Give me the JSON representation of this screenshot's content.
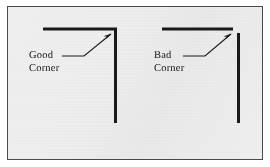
{
  "figure": {
    "background_color": "#eeeeee",
    "border_color": "#4a4a4a",
    "ink_color": "#1a1a1a",
    "page_color": "#ffffff",
    "caption": ""
  },
  "panels": [
    {
      "id": "good",
      "quality": "good",
      "label_line1": "Good",
      "label_line2": "Corner",
      "corner_gap_px": 0,
      "horizontal_line": {
        "x1": 42,
        "y1": 28,
        "x2": 116,
        "y2": 28
      },
      "vertical_line": {
        "x1": 114,
        "y1": 28,
        "x2": 114,
        "y2": 122
      },
      "leader_line": {
        "x1": 61,
        "y1": 55,
        "x2": 83,
        "y2": 55,
        "x3": 111,
        "y3": 33
      },
      "arrow_tip": {
        "x": 111,
        "y": 33
      }
    },
    {
      "id": "bad",
      "quality": "bad",
      "label_line1": "Bad",
      "label_line2": "Corner",
      "corner_gap_px": 5,
      "horizontal_line": {
        "x1": 161,
        "y1": 28,
        "x2": 232,
        "y2": 28
      },
      "vertical_line": {
        "x1": 237,
        "y1": 33,
        "x2": 237,
        "y2": 122
      },
      "leader_line": {
        "x1": 182,
        "y1": 55,
        "x2": 204,
        "y2": 55,
        "x3": 231,
        "y3": 33
      },
      "arrow_tip": {
        "x": 231,
        "y": 33
      }
    }
  ],
  "stroke_widths": {
    "part_line_px": 3,
    "leader_line_px": 1.1,
    "plate_border_px": 1
  }
}
